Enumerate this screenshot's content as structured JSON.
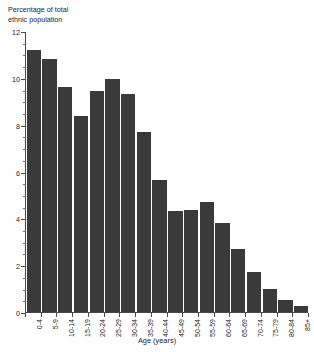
{
  "chart_data": {
    "type": "bar",
    "title": "",
    "subtitle": "",
    "xlabel": "Age (years)",
    "ylabel": "Percentage of total\nethnic population",
    "categories": [
      "0-4",
      "5-9",
      "10-14",
      "15-19",
      "20-24",
      "25-29",
      "30-34",
      "35-39",
      "40-44",
      "45-49",
      "50-54",
      "55-59",
      "60-64",
      "65-69",
      "70-74",
      "75-79",
      "80-84",
      "85+"
    ],
    "values": [
      11.2,
      10.8,
      9.6,
      8.35,
      9.45,
      9.95,
      9.3,
      7.7,
      5.65,
      4.3,
      4.35,
      4.7,
      3.8,
      2.7,
      1.7,
      1.0,
      0.5,
      0.25
    ],
    "ylim": [
      0,
      12
    ],
    "y_major_ticks": [
      0,
      2,
      4,
      6,
      8,
      10,
      12
    ],
    "y_minor_tick_step": 0.5,
    "y_tick_labels": [
      "0",
      "2",
      "4",
      "6",
      "8",
      "10",
      "12"
    ],
    "grid": false,
    "legend": null,
    "legend_position": "none",
    "bar_color": "#3a3a3a",
    "axis_color": "#4a4a4a",
    "background_color": "#ffffff"
  }
}
